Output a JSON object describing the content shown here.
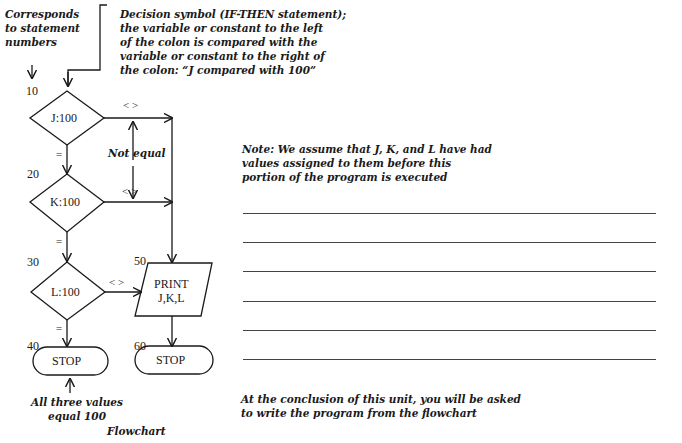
{
  "annotations": {
    "statement_numbers_note": [
      "Corresponds",
      "to statement",
      "numbers"
    ],
    "decision_note": [
      "Decision symbol (IF-THEN statement);",
      "the variable or constant to the left",
      "of the colon is compared with the",
      "variable or constant to the right of",
      "the colon: “J compared with 100”"
    ],
    "not_equal": "Not equal",
    "all_equal": [
      "All three values",
      "equal 100"
    ],
    "caption": "Flowchart"
  },
  "flowchart": {
    "nodes": [
      {
        "id": "n10",
        "number": "10",
        "type": "decision",
        "label": "J:100"
      },
      {
        "id": "n20",
        "number": "20",
        "type": "decision",
        "label": "K:100"
      },
      {
        "id": "n30",
        "number": "30",
        "type": "decision",
        "label": "L:100"
      },
      {
        "id": "n40",
        "number": "40",
        "type": "terminal",
        "label": "STOP"
      },
      {
        "id": "n50",
        "number": "50",
        "type": "io",
        "label_lines": [
          "PRINT",
          "J,K,L"
        ]
      },
      {
        "id": "n60",
        "number": "60",
        "type": "terminal",
        "label": "STOP"
      }
    ],
    "edge_labels": {
      "not_equal": "< >",
      "equal": "="
    }
  },
  "right_panel": {
    "note": [
      "Note: We assume that J, K, and L have had",
      "values assigned to them before this",
      "portion of the program is executed"
    ],
    "blank_lines": 6,
    "conclusion": [
      "At the conclusion of this unit, you will be asked",
      "to write the program from the flowchart"
    ]
  }
}
